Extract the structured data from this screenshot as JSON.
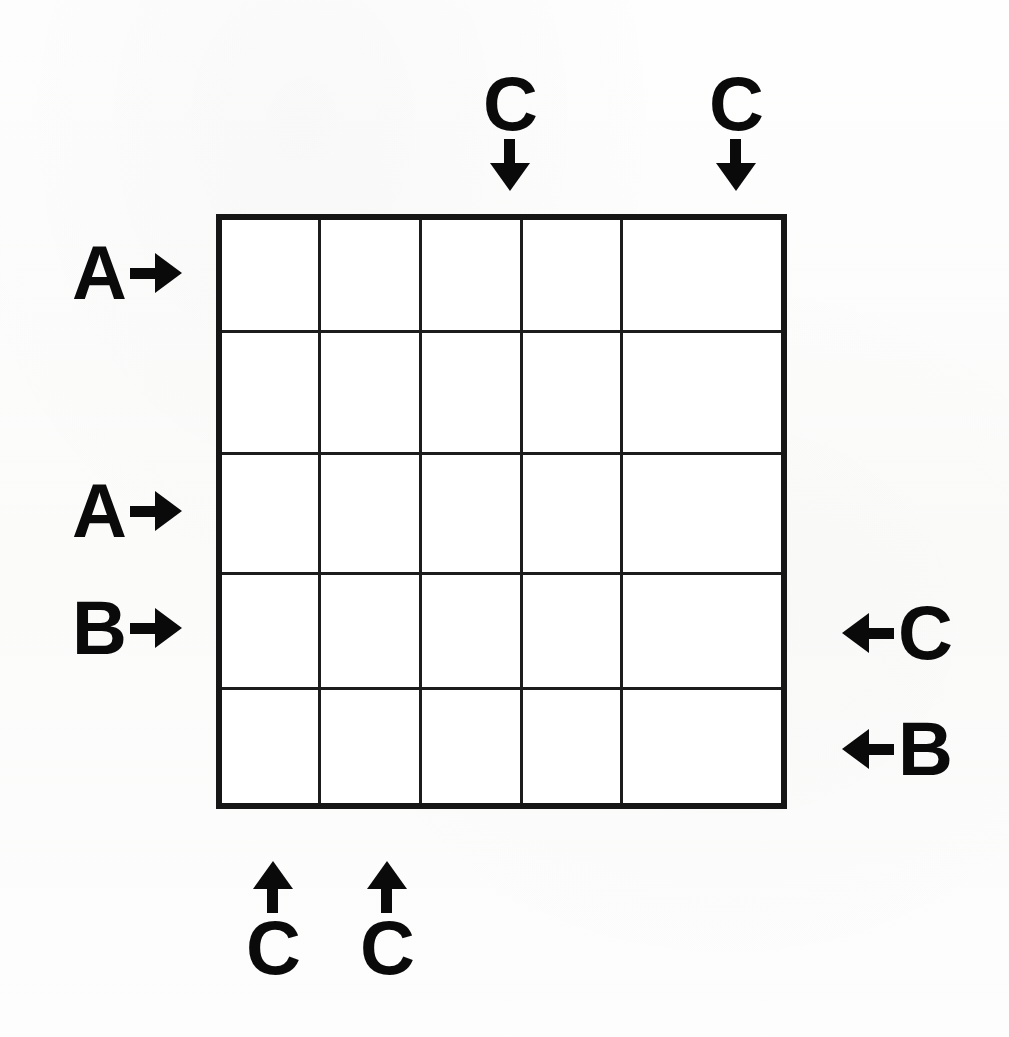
{
  "diagram": {
    "type": "grid-puzzle-with-edge-clues",
    "grid": {
      "rows": 5,
      "columns": 5,
      "cells": [
        [
          "",
          "",
          "",
          "",
          ""
        ],
        [
          "",
          "",
          "",
          "",
          ""
        ],
        [
          "",
          "",
          "",
          "",
          ""
        ],
        [
          "",
          "",
          "",
          "",
          ""
        ],
        [
          "",
          "",
          "",
          "",
          ""
        ]
      ],
      "line_color": "#1c1c1c",
      "border_color": "#161616",
      "fill_color": "#ffffff"
    },
    "background_color": "#fdfdfc",
    "clue_text_color": "#0a0a0a"
  },
  "clues": {
    "top": [
      {
        "label": "C",
        "column": 3,
        "arrow": "arrow-down-icon",
        "direction": "down"
      },
      {
        "label": "C",
        "column": 5,
        "arrow": "arrow-down-icon",
        "direction": "down"
      }
    ],
    "left": [
      {
        "label": "A",
        "row": 1,
        "arrow": "arrow-right-icon",
        "direction": "right"
      },
      {
        "label": "A",
        "row": 3,
        "arrow": "arrow-right-icon",
        "direction": "right"
      },
      {
        "label": "B",
        "row": 4,
        "arrow": "arrow-right-icon",
        "direction": "right"
      }
    ],
    "right": [
      {
        "label": "C",
        "row": 4,
        "arrow": "arrow-left-icon",
        "direction": "left"
      },
      {
        "label": "B",
        "row": 5,
        "arrow": "arrow-left-icon",
        "direction": "left"
      }
    ],
    "bottom": [
      {
        "label": "C",
        "column": 1,
        "arrow": "arrow-up-icon",
        "direction": "up"
      },
      {
        "label": "C",
        "column": 2,
        "arrow": "arrow-up-icon",
        "direction": "up"
      }
    ]
  }
}
